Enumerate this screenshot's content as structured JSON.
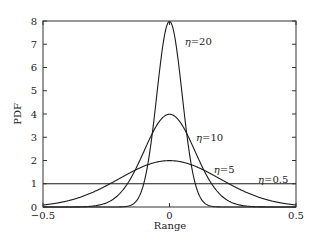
{
  "chart_data": {
    "type": "line",
    "title": "",
    "xlabel": "Range",
    "ylabel": "PDF",
    "xlim": [
      -0.5,
      0.5
    ],
    "ylim": [
      0,
      8
    ],
    "grid": false,
    "legend": "inline annotations",
    "xticks": [
      -0.5,
      0,
      0.5
    ],
    "xtick_labels": [
      "−0.5",
      "0",
      "0.5"
    ],
    "yticks": [
      0,
      1,
      2,
      3,
      4,
      5,
      6,
      7,
      8
    ],
    "ytick_labels": [
      "0",
      "1",
      "2",
      "3",
      "4",
      "5",
      "6",
      "7",
      "8"
    ],
    "series": [
      {
        "name": "η = 20",
        "kind": "gaussian",
        "mean": 0,
        "sigma": 0.05,
        "peak": 7.98,
        "x": [
          -0.5,
          -0.15,
          -0.1,
          -0.05,
          0,
          0.05,
          0.1,
          0.15,
          0.5
        ],
        "values": [
          0.0,
          0.09,
          1.08,
          4.84,
          7.98,
          4.84,
          1.08,
          0.09,
          0.0
        ]
      },
      {
        "name": "η = 10",
        "kind": "gaussian",
        "mean": 0,
        "sigma": 0.1,
        "peak": 3.99,
        "x": [
          -0.5,
          -0.3,
          -0.2,
          -0.1,
          0,
          0.1,
          0.2,
          0.3,
          0.5
        ],
        "values": [
          0.0,
          0.04,
          0.54,
          2.42,
          3.99,
          2.42,
          0.54,
          0.04,
          0.0
        ]
      },
      {
        "name": "η = 5",
        "kind": "gaussian",
        "mean": 0,
        "sigma": 0.2,
        "peak": 1.99,
        "x": [
          -0.5,
          -0.4,
          -0.2,
          0,
          0.2,
          0.4,
          0.5
        ],
        "values": [
          0.09,
          0.27,
          1.21,
          1.99,
          1.21,
          0.27,
          0.09
        ]
      },
      {
        "name": "η = 0.5",
        "kind": "uniform",
        "x": [
          -0.5,
          0.5
        ],
        "values": [
          1.0,
          1.0
        ]
      }
    ],
    "annotations": [
      {
        "eta": "η",
        "eq": "=",
        "value": "20",
        "x": 0.06,
        "y": 7.1
      },
      {
        "eta": "η",
        "eq": "=",
        "value": "10",
        "x": 0.105,
        "y": 3.0
      },
      {
        "eta": "η",
        "eq": "=",
        "value": "5",
        "x": 0.175,
        "y": 1.6
      },
      {
        "eta": "η",
        "eq": "=",
        "value": "0.5",
        "x": 0.35,
        "y": 1.2
      }
    ],
    "colors": {
      "line": "#1a1a1a",
      "axis": "#333333",
      "background": "#ffffff"
    }
  }
}
